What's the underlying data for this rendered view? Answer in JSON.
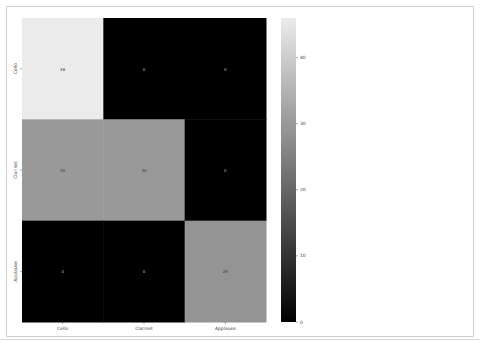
{
  "chart_data": {
    "type": "heatmap",
    "title": "",
    "xlabel": "",
    "ylabel": "",
    "x_categories": [
      "Cello",
      "Clarinet",
      "Applause"
    ],
    "y_categories": [
      "Cello",
      "Clarinet",
      "Applause"
    ],
    "values": [
      [
        46,
        0,
        0
      ],
      [
        30,
        30,
        0
      ],
      [
        0,
        0,
        29
      ]
    ],
    "cell_labels": [
      [
        "46",
        "0",
        "0"
      ],
      [
        "30",
        "30",
        "0"
      ],
      [
        "0",
        "0",
        "29"
      ]
    ],
    "colormap": "gray",
    "colorbar": {
      "range": [
        0,
        46
      ],
      "ticks": [
        0,
        10,
        20,
        30,
        40
      ],
      "tick_labels": [
        "0",
        "10",
        "20",
        "30",
        "40"
      ]
    }
  }
}
